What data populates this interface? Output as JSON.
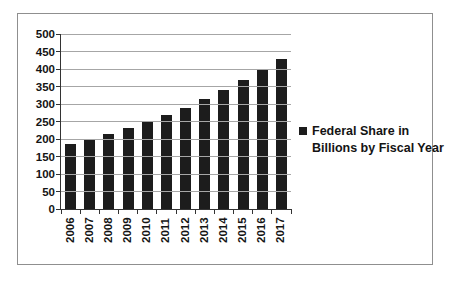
{
  "chart_data": {
    "type": "bar",
    "title": "",
    "xlabel": "",
    "ylabel": "",
    "categories": [
      "2006",
      "2007",
      "2008",
      "2009",
      "2010",
      "2011",
      "2012",
      "2013",
      "2014",
      "2015",
      "2016",
      "2017"
    ],
    "values": [
      185,
      198,
      213,
      231,
      249,
      269,
      290,
      315,
      341,
      369,
      399,
      430
    ],
    "series_name": "Federal Share in Billions by Fiscal Year",
    "legend_lines": [
      "Federal Share in",
      "Billions by Fiscal Year"
    ],
    "legend_position": "right",
    "ylim": [
      0,
      500
    ],
    "ytick_step": 50,
    "ytick_labels": [
      "0",
      "50",
      "100",
      "150",
      "200",
      "250",
      "300",
      "350",
      "400",
      "450",
      "500"
    ],
    "grid": true,
    "bar_color": "#1c1c1c",
    "gridline_color": "#a6a6a6",
    "axis_color": "#333333",
    "text_color": "#141414",
    "chart_border_color": "#8f8f8f",
    "background_color": "#ffffff",
    "legend_marker": "filled-square"
  }
}
